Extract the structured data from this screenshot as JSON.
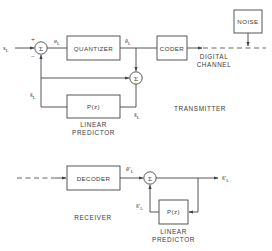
{
  "transmitter": {
    "section_label": "TRANSMITTER",
    "input_signal": "s",
    "input_signal_sub": "L",
    "sum_symbol": "Σ",
    "plus_sign": "+",
    "minus_sign": "−",
    "error_signal": "e",
    "error_signal_sub": "L",
    "quantizer_label": "QUANTIZER",
    "quantized_error": "ẽ",
    "quantized_error_sub": "L",
    "coder_label": "CODER",
    "sum2_symbol": "Σ",
    "predictor_box_label": "P(z)",
    "predictor_caption_line1": "LINEAR",
    "predictor_caption_line2": "PREDICTOR",
    "predicted_signal": "ŝ",
    "predicted_signal_sub": "L",
    "reconstructed_signal": "s̃",
    "reconstructed_signal_sub": "L"
  },
  "channel": {
    "noise_label": "NOISE",
    "caption_line1": "DIGITAL",
    "caption_line2": "CHANNEL"
  },
  "receiver": {
    "section_label": "RECEIVER",
    "decoder_label": "DECODER",
    "received_error": "ẽ′",
    "received_error_sub": "L",
    "sum_symbol": "Σ",
    "output_signal": "s̃′",
    "output_signal_sub": "L",
    "predictor_box_label": "P(z)",
    "predicted_signal": "ŝ′",
    "predicted_signal_sub": "L",
    "predictor_caption_line1": "LINEAR",
    "predictor_caption_line2": "PREDICTOR"
  }
}
